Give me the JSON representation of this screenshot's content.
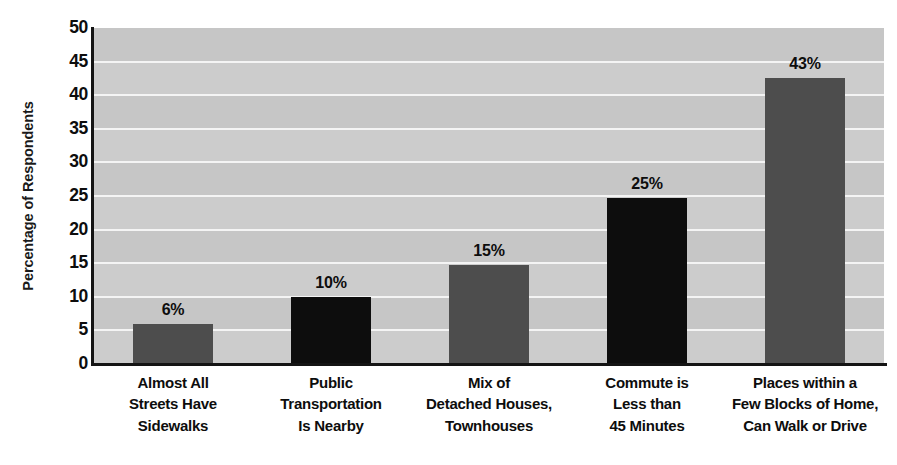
{
  "chart_data": {
    "type": "bar",
    "title": "",
    "xlabel": "",
    "ylabel": "Percentage of Respondents",
    "ylim": [
      0,
      50
    ],
    "ytick_step": 5,
    "grid": true,
    "legend": false,
    "yticks": [
      "50",
      "45",
      "40",
      "35",
      "30",
      "25",
      "20",
      "15",
      "10",
      "5",
      "0"
    ],
    "categories": [
      "Almost All Streets Have Sidewalks",
      "Public Transportation Is Nearby",
      "Mix of Detached Houses, Townhouses",
      "Commute is Less than 45 Minutes",
      "Places within a Few Blocks of Home, Can Walk or Drive"
    ],
    "category_lines": [
      [
        "Almost All",
        "Streets Have",
        "Sidewalks"
      ],
      [
        "Public",
        "Transportation",
        "Is Nearby"
      ],
      [
        "Mix of",
        "Detached Houses,",
        "Townhouses"
      ],
      [
        "Commute is",
        "Less than",
        "45 Minutes"
      ],
      [
        "Places within a",
        "Few Blocks of Home,",
        "Can Walk or Drive"
      ]
    ],
    "values": [
      6,
      10,
      15,
      25,
      43
    ],
    "plotted_values": [
      6.0,
      10.0,
      14.7,
      24.7,
      42.6
    ],
    "data_labels": [
      "6%",
      "10%",
      "15%",
      "25%",
      "43%"
    ],
    "bar_colors": [
      "#4d4d4d",
      "#0d0d0d",
      "#4d4d4d",
      "#0d0d0d",
      "#4d4d4d"
    ]
  },
  "colors": {
    "plot_background": "#cccccc",
    "gridline": "#f4f4f4",
    "axis": "#141414",
    "text": "#0d0d0d",
    "bar_gray": "#4d4d4d",
    "bar_black": "#0d0d0d"
  }
}
